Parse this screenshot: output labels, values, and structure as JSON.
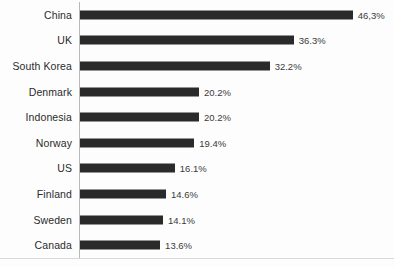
{
  "chart_data": {
    "type": "bar",
    "orientation": "horizontal",
    "title": "",
    "subtitle": "",
    "xlabel": "",
    "ylabel": "",
    "grid": false,
    "legend": false,
    "legend_position": "none",
    "value_suffix": "%",
    "xlim": [
      0,
      46.3
    ],
    "axis_max_reference": 46.3,
    "categories": [
      "China",
      "UK",
      "South Korea",
      "Denmark",
      "Indonesia",
      "Norway",
      "US",
      "Finland",
      "Sweden",
      "Canada"
    ],
    "values": [
      46.3,
      36.3,
      32.2,
      20.2,
      20.2,
      19.4,
      16.1,
      14.6,
      14.1,
      13.6
    ],
    "value_labels": [
      "46,3%",
      "36.3%",
      "32.2%",
      "20.2%",
      "20.2%",
      "19.4%",
      "16.1%",
      "14.6%",
      "14.1%",
      "13.6%"
    ],
    "bars": [
      {
        "category": "China",
        "value": 46.3,
        "label": "46,3%"
      },
      {
        "category": "UK",
        "value": 36.3,
        "label": "36.3%"
      },
      {
        "category": "South Korea",
        "value": 32.2,
        "label": "32.2%"
      },
      {
        "category": "Denmark",
        "value": 20.2,
        "label": "20.2%"
      },
      {
        "category": "Indonesia",
        "value": 20.2,
        "label": "20.2%"
      },
      {
        "category": "Norway",
        "value": 19.4,
        "label": "19.4%"
      },
      {
        "category": "US",
        "value": 16.1,
        "label": "16.1%"
      },
      {
        "category": "Finland",
        "value": 14.6,
        "label": "14.6%"
      },
      {
        "category": "Sweden",
        "value": 14.1,
        "label": "14.1%"
      },
      {
        "category": "Canada",
        "value": 13.6,
        "label": "13.6%"
      }
    ],
    "colors": {
      "bar": "#2a2a2a",
      "background": "#fdfdfd",
      "label_text": "#2b2b2b",
      "value_text": "#3a3a3a",
      "axis_line": "#b9b9b9",
      "frame_line": "#d8d8d8"
    }
  }
}
